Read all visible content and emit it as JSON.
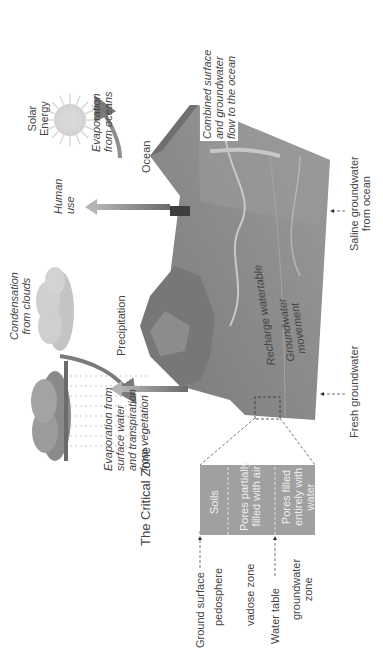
{
  "diagram": {
    "orientation": "rotated 90 degrees counter-clockwise",
    "title": "The Critical Zone",
    "colors": {
      "terrain": "#8a8a8a",
      "terrain_dark": "#6e6e6e",
      "ocean": "#9a9a9a",
      "arrow": "#8c8c8c",
      "sun": "#d6d6d6",
      "cloud": "#bdbdbd",
      "background": "#ffffff"
    },
    "critical_zone": {
      "left_labels": {
        "ground_surface": "Ground surface",
        "pedosphere": "pedosphere",
        "vadose_zone": "vadose zone",
        "water_table": "Water table",
        "groundwater_zone": "groundwater zone"
      },
      "layers": [
        {
          "label": "Soils"
        },
        {
          "label": "Pores partially filled with air"
        },
        {
          "label": "Pores filled entirely with water"
        }
      ]
    },
    "labels": {
      "solar_energy": "Solar Energy",
      "evaporation_oceans": "Evaporation from oceans",
      "ocean": "Ocean",
      "condensation": "Condensation from clouds",
      "human_use": "Human use",
      "precipitation": "Precipitation",
      "evaporation_surface": "Evaporation from surface water and transpiration from vegetation",
      "combined_flow": "Combined surface and groundwater flow to the ocean",
      "recharge": "Recharge watertable",
      "groundwater_movement": "Groundwater movement",
      "fresh_groundwater": "Fresh groundwater",
      "saline_groundwater": "Saline groundwater from ocean"
    },
    "label_lines": {
      "solar_energy": [
        "Solar",
        "Energy"
      ],
      "evaporation_oceans": [
        "Evaporation",
        "from oceans"
      ],
      "condensation": [
        "Condensation",
        "from clouds"
      ],
      "human_use": [
        "Human",
        "use"
      ],
      "evaporation_surface": [
        "Evaporation from",
        "surface water",
        "and transpiration",
        "from vegetation"
      ],
      "combined_flow": [
        "Combined surface",
        "and groundwater",
        "flow to the ocean"
      ],
      "groundwater_movement": [
        "Groundwater",
        "movement"
      ],
      "saline_groundwater": [
        "Saline groundwater",
        "from ocean"
      ],
      "pores_air": [
        "Pores partially",
        "filled with air"
      ],
      "pores_water": [
        "Pores filled",
        "entirely with",
        "water"
      ],
      "groundwater_zone": [
        "groundwater",
        "zone"
      ]
    }
  }
}
